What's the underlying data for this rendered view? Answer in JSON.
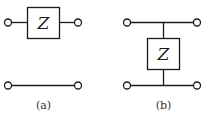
{
  "diagram": {
    "panels": [
      {
        "id": "a",
        "caption": "(a)",
        "description": "Series impedance Z in top line; bottom line is a plain wire",
        "element_label": "Z",
        "topology": "series"
      },
      {
        "id": "b",
        "caption": "(b)",
        "description": "Shunt impedance Z connected between top and bottom lines",
        "element_label": "Z",
        "topology": "shunt"
      }
    ]
  },
  "colors": {
    "stroke": "#1a1a1a",
    "background": "#ffffff"
  }
}
